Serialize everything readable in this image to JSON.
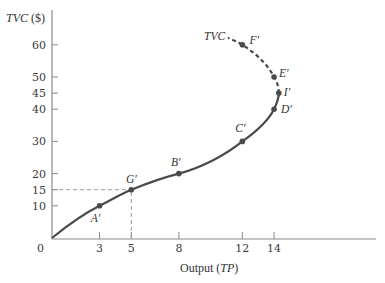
{
  "chart_data": {
    "type": "line",
    "title": "",
    "xlabel": "Output (TP)",
    "xlabel_main": "Output (",
    "xlabel_italic": "TP",
    "xlabel_close": ")",
    "ylabel": "TVC ($)",
    "ylabel_italic": "TVC",
    "ylabel_unit": " ($)",
    "origin_label": "0",
    "xlim": [
      0,
      20
    ],
    "ylim": [
      0,
      65
    ],
    "grid": false,
    "legend": "none",
    "x_ticks": [
      {
        "value": 3,
        "label": "3"
      },
      {
        "value": 5,
        "label": "5"
      },
      {
        "value": 8,
        "label": "8"
      },
      {
        "value": 12,
        "label": "12"
      },
      {
        "value": 14,
        "label": "14"
      }
    ],
    "y_ticks": [
      {
        "value": 10,
        "label": "10"
      },
      {
        "value": 15,
        "label": "15"
      },
      {
        "value": 20,
        "label": "20"
      },
      {
        "value": 30,
        "label": "30"
      },
      {
        "value": 40,
        "label": "40"
      },
      {
        "value": 45,
        "label": "45"
      },
      {
        "value": 50,
        "label": "50"
      },
      {
        "value": 60,
        "label": "60"
      }
    ],
    "series": [
      {
        "name": "TVC",
        "label": "TVC",
        "segments": [
          {
            "style": "solid",
            "x": [
              0,
              3,
              5,
              8,
              12,
              14,
              14.3
            ],
            "y": [
              0,
              10,
              15,
              20,
              30,
              40,
              45
            ]
          },
          {
            "style": "dashed",
            "x": [
              14.3,
              14,
              12,
              11.2
            ],
            "y": [
              45,
              50,
              60,
              62
            ]
          }
        ],
        "points": [
          {
            "label": "A′",
            "x": 3,
            "y": 10
          },
          {
            "label": "G′",
            "x": 5,
            "y": 15
          },
          {
            "label": "B′",
            "x": 8,
            "y": 20
          },
          {
            "label": "C′",
            "x": 12,
            "y": 30
          },
          {
            "label": "D′",
            "x": 14,
            "y": 40
          },
          {
            "label": "I′",
            "x": 14.3,
            "y": 45
          },
          {
            "label": "E′",
            "x": 14,
            "y": 50
          },
          {
            "label": "F′",
            "x": 12,
            "y": 60
          }
        ]
      }
    ],
    "annotations": [
      {
        "type": "dashed-guide",
        "from": [
          0,
          15
        ],
        "to": [
          5,
          15
        ]
      },
      {
        "type": "dashed-guide",
        "from": [
          5,
          0
        ],
        "to": [
          5,
          15
        ]
      }
    ]
  },
  "colors": {
    "curve": "#4a4a4a",
    "axis": "#8a8a8a",
    "guide": "#9a9a9a",
    "text": "#333333"
  }
}
